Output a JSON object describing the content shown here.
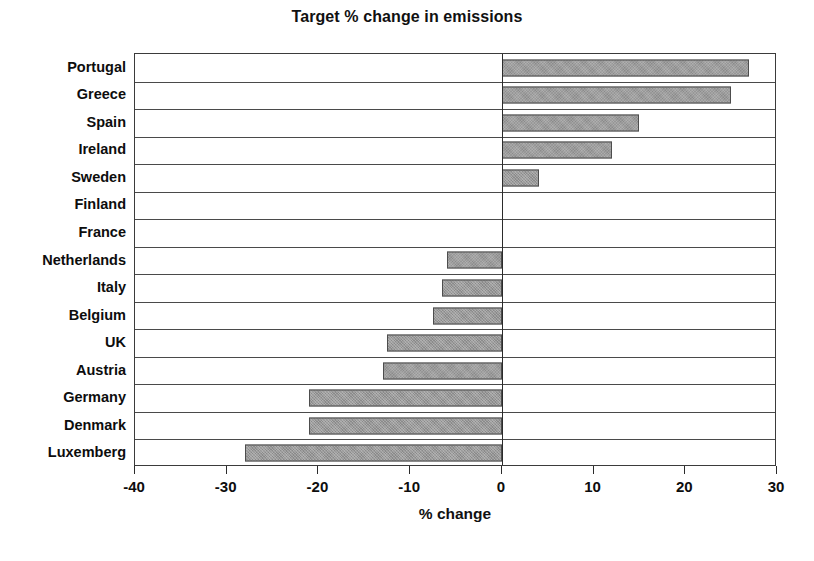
{
  "chart_data": {
    "type": "bar",
    "orientation": "horizontal",
    "title": "Target % change in emissions",
    "xlabel": "% change",
    "ylabel": "",
    "categories": [
      "Portugal",
      "Greece",
      "Spain",
      "Ireland",
      "Sweden",
      "Finland",
      "France",
      "Netherlands",
      "Italy",
      "Belgium",
      "UK",
      "Austria",
      "Germany",
      "Denmark",
      "Luxemberg"
    ],
    "values": [
      27,
      25,
      15,
      12,
      4,
      0,
      0,
      -6,
      -6.5,
      -7.5,
      -12.5,
      -13,
      -21,
      -21,
      -28
    ],
    "xlim": [
      -40,
      30
    ],
    "xticks": [
      -40,
      -30,
      -20,
      -10,
      0,
      10,
      20,
      30
    ],
    "xtick_labels": [
      "-40",
      "-30",
      "-20",
      "-10",
      "0",
      "10",
      "20",
      "30"
    ],
    "grid": "horizontal-category-separators",
    "legend": "none",
    "bar_color": "#9a9a9a",
    "bar_border_color": "#4d4d4d",
    "axis_color": "#2b2b2b",
    "zero_line": 0
  }
}
